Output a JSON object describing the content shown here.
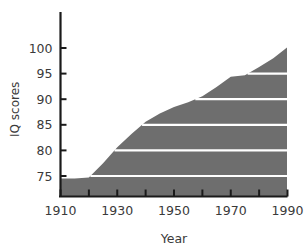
{
  "chart_data": {
    "type": "area",
    "title": "",
    "xlabel": "Year",
    "ylabel": "IQ scores",
    "xlim": [
      1910,
      1990
    ],
    "ylim": [
      72.5,
      101.5
    ],
    "grid": true,
    "legend": null,
    "fill_color": "#6e6e6e",
    "gridline_color": "#ffffff",
    "axis_color": "#1a1a1a",
    "text_color": "#3a3a3a",
    "x_ticks_major": [
      1910,
      1930,
      1950,
      1970,
      1990
    ],
    "x_tick_labels": [
      "1910",
      "1930",
      "1950",
      "1970",
      "1990"
    ],
    "x_ticks_minor": [
      1920,
      1940,
      1960,
      1980
    ],
    "y_ticks": [
      75,
      80,
      85,
      90,
      95,
      100
    ],
    "y_tick_labels": [
      "75",
      "80",
      "85",
      "90",
      "95",
      "100"
    ],
    "gridline_values": [
      75,
      80,
      85,
      90,
      95
    ],
    "x": [
      1910,
      1915,
      1920,
      1925,
      1930,
      1935,
      1940,
      1945,
      1950,
      1955,
      1960,
      1965,
      1970,
      1975,
      1980,
      1985,
      1990
    ],
    "values": [
      74.5,
      74.5,
      74.7,
      77.5,
      80.6,
      83.2,
      85.6,
      87.2,
      88.5,
      89.4,
      90.6,
      92.4,
      94.4,
      94.7,
      96.3,
      98.0,
      100.2
    ],
    "series": [
      {
        "name": "IQ scores",
        "values": [
          74.5,
          74.5,
          74.7,
          77.5,
          80.6,
          83.2,
          85.6,
          87.2,
          88.5,
          89.4,
          90.6,
          92.4,
          94.4,
          94.7,
          96.3,
          98.0,
          100.2
        ]
      }
    ]
  },
  "axes": {
    "y_axis_title": "IQ scores",
    "x_axis_title": "Year"
  }
}
